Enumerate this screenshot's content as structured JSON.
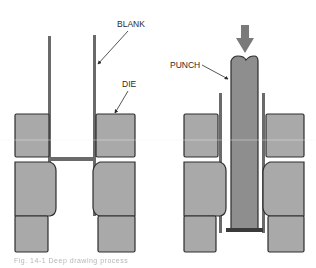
{
  "diagram": {
    "type": "deep-drawing process illustration",
    "colors": {
      "die_fill": "#a9a9a9",
      "punch_fill": "#8e8e8e",
      "blank_stroke": "#6a6a6a",
      "outline": "#2e2e2e",
      "arrow": "#7a7a7a"
    },
    "left_panel": {
      "labels": {
        "blank": "BLANK",
        "die": "DIE"
      }
    },
    "right_panel": {
      "labels": {
        "punch": "PUNCH"
      },
      "force_arrow": "down-arrow"
    },
    "caption": "Fig. 14-1 Deep drawing process"
  }
}
